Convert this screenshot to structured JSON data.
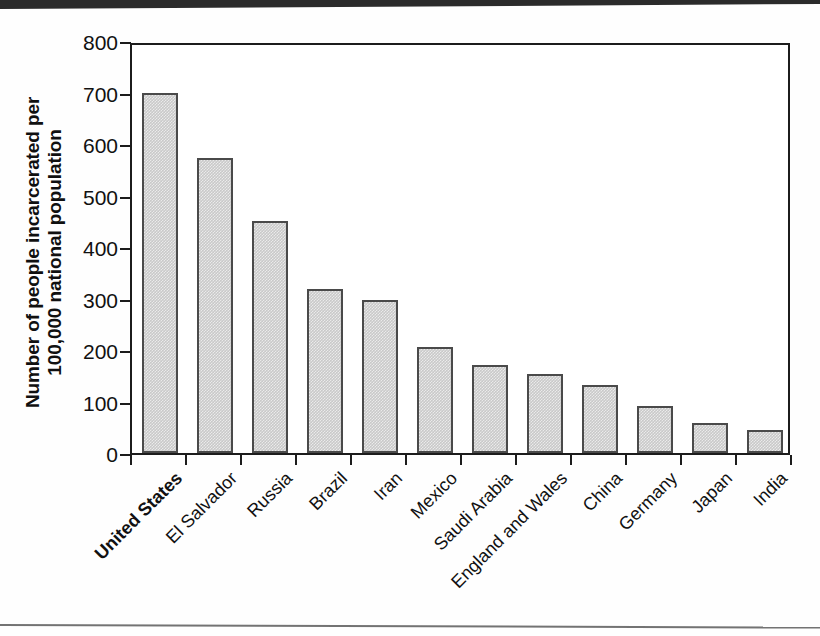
{
  "figure": {
    "background_color": "#ffffff",
    "frame_color": "#1c1c1c",
    "bar_fill_color": "#c9c9c9",
    "bar_border_color": "#4a4a4a"
  },
  "axis": {
    "y_title_line1": "Number of people incarcerated per",
    "y_title_line2": "100,000 national population",
    "y_ticks": [
      "800",
      "700",
      "600",
      "500",
      "400",
      "300",
      "200",
      "100",
      "0"
    ]
  },
  "chart_data": {
    "type": "bar",
    "title": "",
    "xlabel": "",
    "ylabel": "Number of people incarcerated per 100,000 national population",
    "ylim": [
      0,
      800
    ],
    "ytick_values": [
      0,
      100,
      200,
      300,
      400,
      500,
      600,
      700,
      800
    ],
    "grid": false,
    "legend": "none",
    "highlighted_category": "United States",
    "categories": [
      "United States",
      "El Salvador",
      "Russia",
      "Brazil",
      "Iran",
      "Mexico",
      "Saudi Arabia",
      "England and Wales",
      "China",
      "Germany",
      "Japan",
      "India"
    ],
    "values": [
      700,
      573,
      450,
      318,
      297,
      205,
      170,
      154,
      132,
      92,
      58,
      44
    ]
  }
}
